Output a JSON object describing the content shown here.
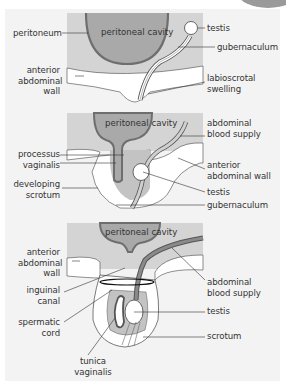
{
  "diagram": {
    "colors": {
      "background": "#f3f3f3",
      "body_wall": "#d4d4d4",
      "cavity": "#a9a9a9",
      "peritoneum_line": "#6e6e6e",
      "white_tissue": "#ffffff",
      "leader_line": "#333333"
    },
    "panels": [
      {
        "id": "stage-1",
        "cavity_label": "peritoneal cavity",
        "labels_left": [
          {
            "text": "peritoneum"
          },
          {
            "text": "anterior\nabdominal\nwall"
          }
        ],
        "labels_right": [
          {
            "text": "testis"
          },
          {
            "text": "gubernaculum"
          },
          {
            "text": "labioscrotal\nswelling"
          }
        ]
      },
      {
        "id": "stage-2",
        "cavity_label": "peritoneal cavity",
        "labels_left": [
          {
            "text": "processus\nvaginalis"
          },
          {
            "text": "developing\nscrotum"
          }
        ],
        "labels_right": [
          {
            "text": "abdominal\nblood supply"
          },
          {
            "text": "anterior\nabdominal wall"
          },
          {
            "text": "testis"
          },
          {
            "text": "gubernaculum"
          }
        ]
      },
      {
        "id": "stage-3",
        "cavity_label": "peritoneal cavity",
        "labels_left": [
          {
            "text": "anterior\nabdominal\nwall"
          },
          {
            "text": "inguinal\ncanal"
          },
          {
            "text": "spermatic\ncord"
          }
        ],
        "labels_right": [
          {
            "text": "abdominal\nblood supply"
          },
          {
            "text": "testis"
          },
          {
            "text": "scrotum"
          }
        ],
        "labels_bottom": [
          {
            "text": "tunica\nvaginalis"
          }
        ]
      }
    ]
  }
}
